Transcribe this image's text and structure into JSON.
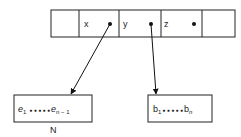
{
  "record": {
    "cells": [
      {
        "label": "",
        "has_pointer": false
      },
      {
        "label": "x",
        "has_pointer": true
      },
      {
        "label": "y",
        "has_pointer": true
      },
      {
        "label": "z",
        "has_pointer": true
      },
      {
        "label": "",
        "has_pointer": false
      }
    ]
  },
  "left_box": {
    "first": "e",
    "first_sub": "1",
    "dots": "● ● ● ● ●",
    "last": "e",
    "last_sub": "n − 1",
    "caption": "N"
  },
  "right_box": {
    "first": "b",
    "first_sub": "1",
    "dots": "● ● ● ● ●",
    "last": "b",
    "last_sub": "n"
  },
  "arrows": [
    {
      "from": "x",
      "to": "left_box"
    },
    {
      "from": "y",
      "to": "right_box"
    }
  ]
}
